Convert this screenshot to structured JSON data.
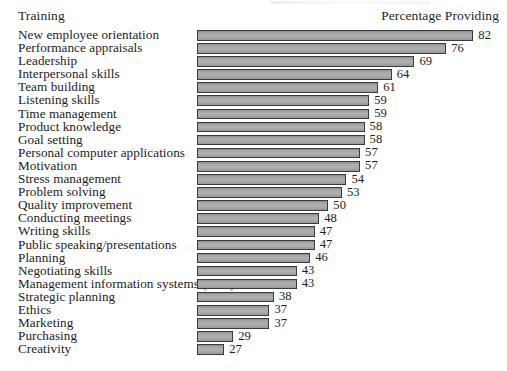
{
  "header": {
    "left_label": "Training",
    "right_label": "Percentage Providing"
  },
  "chart_data": {
    "type": "bar",
    "orientation": "horizontal",
    "title": "",
    "subtitle": "",
    "xlabel": "Percentage Providing",
    "ylabel": "Training",
    "grid": false,
    "legend": false,
    "axis_note": "Bars drawn on a truncated axis; value labels shown at bar ends.",
    "xlim": [
      21,
      85
    ],
    "categories": [
      "New employee orientation",
      "Performance appraisals",
      "Leadership",
      "Interpersonal skills",
      "Team building",
      "Listening skills",
      "Time management",
      "Product knowledge",
      "Goal setting",
      "Personal computer applications",
      "Motivation",
      "Stress management",
      "Problem solving",
      "Quality improvement",
      "Conducting meetings",
      "Writing skills",
      "Public speaking/presentations",
      "Planning",
      "Negotiating skills",
      "Management information systems (MIS)",
      "Strategic planning",
      "Ethics",
      "Marketing",
      "Purchasing",
      "Creativity"
    ],
    "values": [
      82,
      76,
      69,
      64,
      61,
      59,
      59,
      58,
      58,
      57,
      57,
      54,
      53,
      50,
      48,
      47,
      47,
      46,
      43,
      43,
      38,
      37,
      37,
      29,
      27
    ],
    "value_labels": [
      "82",
      "76",
      "69",
      "64",
      "61",
      "59",
      "59",
      "58",
      "58",
      "57",
      "57",
      "54",
      "53",
      "50",
      "48",
      "47",
      "47",
      "46",
      "43",
      "43",
      "38",
      "37",
      "37",
      "29",
      "27"
    ],
    "colors": {
      "bar_fill": "#a8a8a8",
      "bar_border": "#3a3a3a",
      "background": "#ffffff",
      "text": "#1c1c1c"
    }
  }
}
